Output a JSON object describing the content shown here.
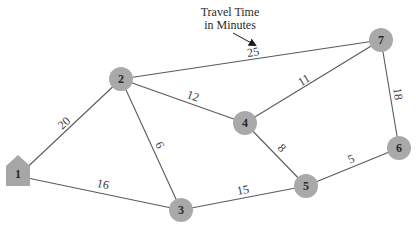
{
  "annotation": {
    "line1": "Travel Time",
    "line2": "in Minutes"
  },
  "colors": {
    "node_fill": "#a9a9a9",
    "edge": "#5a5a5a",
    "text": "#2a2a2a"
  },
  "nodes": [
    {
      "id": "1",
      "label": "1",
      "shape": "house",
      "x": 18,
      "y": 176
    },
    {
      "id": "2",
      "label": "2",
      "shape": "circle",
      "x": 121,
      "y": 79
    },
    {
      "id": "3",
      "label": "3",
      "shape": "circle",
      "x": 181,
      "y": 210
    },
    {
      "id": "4",
      "label": "4",
      "shape": "circle",
      "x": 245,
      "y": 123
    },
    {
      "id": "5",
      "label": "5",
      "shape": "circle",
      "x": 306,
      "y": 186
    },
    {
      "id": "6",
      "label": "6",
      "shape": "circle",
      "x": 399,
      "y": 148
    },
    {
      "id": "7",
      "label": "7",
      "shape": "circle",
      "x": 381,
      "y": 40
    }
  ],
  "edges": [
    {
      "from": "1",
      "to": "2",
      "weight": "20"
    },
    {
      "from": "1",
      "to": "3",
      "weight": "16"
    },
    {
      "from": "2",
      "to": "3",
      "weight": "6"
    },
    {
      "from": "2",
      "to": "4",
      "weight": "12"
    },
    {
      "from": "2",
      "to": "7",
      "weight": "25"
    },
    {
      "from": "3",
      "to": "5",
      "weight": "15"
    },
    {
      "from": "4",
      "to": "5",
      "weight": "8"
    },
    {
      "from": "4",
      "to": "7",
      "weight": "11"
    },
    {
      "from": "5",
      "to": "6",
      "weight": "5"
    },
    {
      "from": "6",
      "to": "7",
      "weight": "18"
    }
  ]
}
